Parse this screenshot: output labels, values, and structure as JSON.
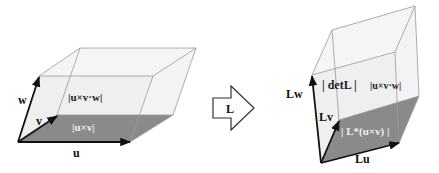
{
  "figure": {
    "left_box": {
      "vec_u": "u",
      "vec_v": "v",
      "vec_w": "w",
      "volume_label": "|u×v·w|",
      "base_label": "|u×v|"
    },
    "transform": {
      "label": "L"
    },
    "right_box": {
      "vec_u": "Lu",
      "vec_v": "Lv",
      "vec_w": "Lw",
      "volume_label_det": "| detL |",
      "volume_label_rest": "|u×v·w|",
      "base_label": "| L*(u×v) |"
    },
    "colors": {
      "face_fill": "#f0f0f0",
      "base_fill": "#8a8a8a",
      "edge": "#888888",
      "arrow": "#111111",
      "base_text": "#eeeeee"
    }
  }
}
